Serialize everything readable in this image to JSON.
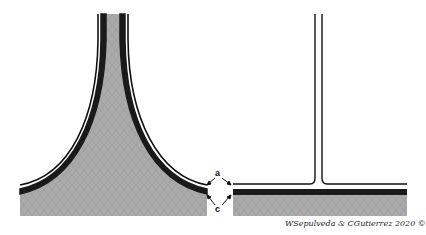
{
  "figure": {
    "left_panel": {
      "description": "flared (trumpet-shaped) junction with thick wall layers"
    },
    "right_panel": {
      "description": "sharp T-shaped junction with thin wall layers"
    },
    "labels": {
      "a": "a",
      "c": "c"
    },
    "credit": "WSepulveda & CGutierrez 2020 ©",
    "colors": {
      "fill_gray": "#a9a9a9",
      "band_black": "#1a1a1a",
      "line_black": "#111111",
      "background": "#ffffff"
    }
  }
}
